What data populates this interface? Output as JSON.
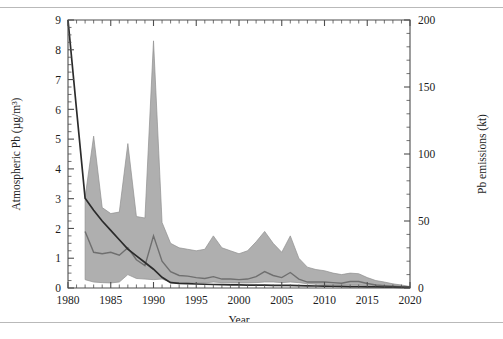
{
  "figure": {
    "name": "atmospheric-lead-and-emissions-chart"
  },
  "chart_data": {
    "type": "area",
    "title": "",
    "xlabel": "Year",
    "ylabel": "Atmospheric Pb (µg/m³)",
    "y2label": "Pb emissions (kt)",
    "xlim": [
      1980,
      2020
    ],
    "ylim": [
      0,
      9
    ],
    "y2lim": [
      0,
      200
    ],
    "grid": false,
    "legend": "none",
    "x_ticks": [
      1980,
      1985,
      1990,
      1995,
      2000,
      2005,
      2010,
      2015,
      2020
    ],
    "x_tick_labels": [
      "1980",
      "1985",
      "1990",
      "1995",
      "2000",
      "2005",
      "2010",
      "2015",
      "2020"
    ],
    "x_minor_tick_step": 1,
    "y_ticks": [
      0,
      1,
      2,
      3,
      4,
      5,
      6,
      7,
      8,
      9
    ],
    "y_tick_labels": [
      "0",
      "1",
      "2",
      "3",
      "4",
      "5",
      "6",
      "7",
      "8",
      "9"
    ],
    "y_minor_tick_step": 0.25,
    "y2_ticks": [
      0,
      50,
      100,
      150,
      200
    ],
    "y2_tick_labels": [
      "0",
      "50",
      "100",
      "150",
      "200"
    ],
    "y2_minor_tick_step": 10,
    "series": [
      {
        "name": "Atmospheric Pb range (shaded band)",
        "type": "band",
        "axis": "left",
        "color": "#a8a8a8",
        "x": [
          1982,
          1983,
          1984,
          1985,
          1986,
          1987,
          1988,
          1989,
          1990,
          1991,
          1992,
          1993,
          1994,
          1995,
          1996,
          1997,
          1998,
          1999,
          2000,
          2001,
          2002,
          2003,
          2004,
          2005,
          2006,
          2007,
          2008,
          2009,
          2010,
          2011,
          2012,
          2013,
          2014,
          2015,
          2016,
          2017,
          2018,
          2019,
          2020
        ],
        "upper": [
          3.05,
          5.1,
          2.7,
          2.5,
          2.55,
          4.85,
          2.4,
          2.35,
          8.3,
          2.2,
          1.5,
          1.35,
          1.3,
          1.25,
          1.3,
          1.75,
          1.35,
          1.25,
          1.15,
          1.25,
          1.55,
          1.9,
          1.5,
          1.2,
          1.75,
          1.0,
          0.7,
          0.62,
          0.58,
          0.5,
          0.45,
          0.5,
          0.48,
          0.35,
          0.25,
          0.2,
          0.14,
          0.1,
          0.05
        ],
        "lower": [
          0.28,
          0.2,
          0.18,
          0.17,
          0.2,
          0.45,
          0.32,
          0.3,
          0.28,
          0.3,
          0.2,
          0.18,
          0.18,
          0.17,
          0.17,
          0.2,
          0.18,
          0.17,
          0.17,
          0.17,
          0.18,
          0.2,
          0.2,
          0.18,
          0.2,
          0.18,
          0.14,
          0.13,
          0.12,
          0.1,
          0.1,
          0.1,
          0.1,
          0.08,
          0.06,
          0.05,
          0.04,
          0.03,
          0.02
        ]
      },
      {
        "name": "Atmospheric Pb median",
        "type": "line",
        "axis": "left",
        "color": "#6f6f6f",
        "x": [
          1982,
          1983,
          1984,
          1985,
          1986,
          1987,
          1988,
          1989,
          1990,
          1991,
          1992,
          1993,
          1994,
          1995,
          1996,
          1997,
          1998,
          1999,
          2000,
          2001,
          2002,
          2003,
          2004,
          2005,
          2006,
          2007,
          2008,
          2009,
          2010,
          2011,
          2012,
          2013,
          2014,
          2015,
          2016,
          2017,
          2018,
          2019,
          2020
        ],
        "values": [
          1.9,
          1.2,
          1.15,
          1.2,
          1.1,
          1.35,
          0.95,
          0.75,
          1.75,
          0.9,
          0.55,
          0.42,
          0.4,
          0.35,
          0.32,
          0.38,
          0.3,
          0.3,
          0.28,
          0.3,
          0.38,
          0.55,
          0.42,
          0.35,
          0.52,
          0.3,
          0.2,
          0.2,
          0.2,
          0.18,
          0.16,
          0.22,
          0.22,
          0.15,
          0.1,
          0.08,
          0.06,
          0.04,
          0.03
        ]
      },
      {
        "name": "Pb emissions",
        "type": "line",
        "axis": "right",
        "color": "#2b2b2b",
        "x": [
          1980,
          1981,
          1982,
          1983,
          1984,
          1985,
          1986,
          1987,
          1988,
          1989,
          1990,
          1991,
          1992,
          1993,
          1994,
          1995,
          1996,
          1997,
          1998,
          1999,
          2000,
          2001,
          2002,
          2003,
          2004,
          2005,
          2006,
          2007,
          2008,
          2009,
          2010,
          2011,
          2012,
          2013,
          2014,
          2015,
          2016,
          2017,
          2018,
          2019,
          2020
        ],
        "values": [
          200,
          133,
          67,
          58,
          50,
          43,
          36,
          29,
          24,
          19,
          14,
          8,
          4,
          3.5,
          3.2,
          3,
          2.8,
          2.6,
          2.5,
          2.4,
          2.3,
          2.2,
          2.1,
          2.1,
          2.0,
          2.0,
          1.9,
          1.8,
          1.6,
          1.5,
          1.4,
          1.3,
          1.2,
          1.1,
          1.0,
          0.9,
          0.8,
          0.7,
          0.6,
          0.5,
          0.4
        ]
      }
    ]
  }
}
